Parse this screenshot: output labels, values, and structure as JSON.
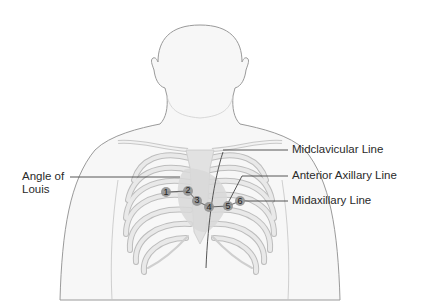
{
  "labels": {
    "angle_of_louis": "Angle of Louis",
    "angle_line1": "Angle of",
    "angle_line2": "Louis",
    "midclavicular": "Midclavicular Line",
    "anterior_axillary": "Anterior Axillary Line",
    "midaxillary": "Midaxillary Line"
  },
  "electrodes": [
    {
      "id": "1",
      "x": 166,
      "y": 192
    },
    {
      "id": "2",
      "x": 188,
      "y": 191
    },
    {
      "id": "3",
      "x": 197,
      "y": 201
    },
    {
      "id": "4",
      "x": 209,
      "y": 207
    },
    {
      "id": "5",
      "x": 228,
      "y": 206
    },
    {
      "id": "6",
      "x": 240,
      "y": 201
    }
  ],
  "colors": {
    "outline": "#9a9a9a",
    "skin": "#f7f7f7",
    "rib": "#e6e6e6",
    "rib_edge": "#bdbdbd",
    "heart": "#d8d8d8",
    "electrode": "#8d8d8d",
    "leader": "#444444"
  }
}
